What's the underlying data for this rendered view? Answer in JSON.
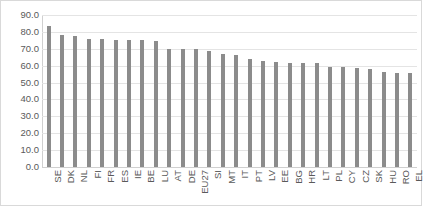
{
  "chart_data": {
    "type": "bar",
    "title": "",
    "subtitle": "",
    "xlabel": "",
    "ylabel": "",
    "ylim": [
      0.0,
      90.0
    ],
    "ytick_step": 10.0,
    "grid": true,
    "legend": false,
    "legend_position": "none",
    "orientation": "vertical",
    "bar_color": "#8c8c8c",
    "gridline_color": "#e4e4e4",
    "axis_color": "#d0d0d0",
    "tick_label_color": "#5a5a5a",
    "xtick_rotation": 90,
    "ytick_labels": [
      "90.0",
      "80.0",
      "70.0",
      "60.0",
      "50.0",
      "40.0",
      "30.0",
      "20.0",
      "10.0",
      "0.0"
    ],
    "yticks": [
      90.0,
      80.0,
      70.0,
      60.0,
      50.0,
      40.0,
      30.0,
      20.0,
      10.0,
      0.0
    ],
    "categories": [
      "SE",
      "DK",
      "NL",
      "FI",
      "FR",
      "ES",
      "IE",
      "BE",
      "LU",
      "AT",
      "DE",
      "EU27",
      "SI",
      "MT",
      "IT",
      "PT",
      "LV",
      "EE",
      "BG",
      "HR",
      "LT",
      "PL",
      "CY",
      "CZ",
      "SK",
      "HU",
      "RO",
      "EL"
    ],
    "values": [
      83.5,
      78.3,
      77.7,
      75.9,
      75.8,
      75.2,
      75.2,
      75.2,
      74.5,
      69.7,
      69.7,
      69.6,
      68.5,
      66.8,
      66.2,
      64.1,
      62.7,
      62.0,
      61.8,
      61.7,
      61.8,
      59.2,
      59.0,
      58.9,
      57.8,
      56.2,
      55.8,
      55.4
    ],
    "series": [
      {
        "name": "",
        "values": [
          83.5,
          78.3,
          77.7,
          75.9,
          75.8,
          75.2,
          75.2,
          75.2,
          74.5,
          69.7,
          69.7,
          69.6,
          68.5,
          66.8,
          66.2,
          64.1,
          62.7,
          62.0,
          61.8,
          61.7,
          61.8,
          59.2,
          59.0,
          58.9,
          57.8,
          56.2,
          55.8,
          55.4
        ]
      }
    ],
    "annotations": []
  }
}
